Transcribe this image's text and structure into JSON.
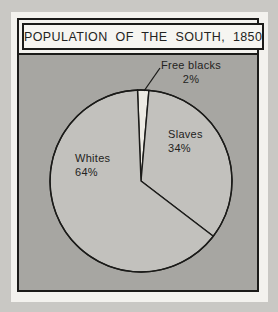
{
  "header": {
    "title": "POPULATION OF THE SOUTH, 1850"
  },
  "chart_data": {
    "type": "pie",
    "title": "POPULATION OF THE SOUTH, 1850",
    "slices": [
      {
        "label": "Free blacks",
        "value": 2,
        "pct_label": "2%",
        "color": "#edebe4"
      },
      {
        "label": "Slaves",
        "value": 34,
        "pct_label": "34%",
        "color": "#c2c1bd"
      },
      {
        "label": "Whites",
        "value": 64,
        "pct_label": "64%",
        "color": "#c2c1bd"
      }
    ],
    "start_angle_deg": -2.2,
    "outline_color": "#1b1b19",
    "labels_placement": "Free blacks outside with callout line; Slaves and Whites inside slices"
  },
  "colors": {
    "page_background": "#c9c8c4",
    "mat_background": "#f3f2ee",
    "chart_background": "#a7a6a2",
    "title_background": "#f6f5f1",
    "border": "#1b1b19",
    "text": "#232321"
  }
}
